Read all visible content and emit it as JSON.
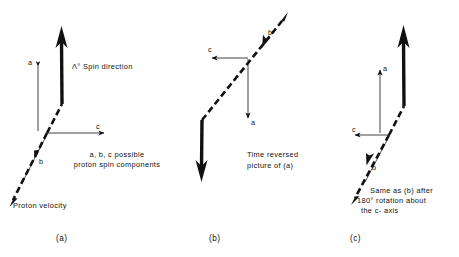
{
  "figure": {
    "title_visible": false,
    "background_color": "#ffffff",
    "ink_color": "#111111"
  },
  "panels": [
    {
      "id": "a",
      "panel_label": "(a)",
      "annotations": {
        "spin_direction": "Λ° Spin direction",
        "components_note_line1": "a, b, c possible",
        "components_note_line2": "proton spin components",
        "velocity_label": "Proton velocity"
      },
      "axes": [
        {
          "name": "a",
          "label": "a",
          "direction": "down"
        },
        {
          "name": "b",
          "label": "b",
          "direction": "up-right"
        },
        {
          "name": "c",
          "label": "c",
          "direction": "right"
        }
      ],
      "vectors": [
        {
          "name": "lambda-spin",
          "style": "thick-solid",
          "direction": "up"
        },
        {
          "name": "proton-velocity",
          "style": "dashed",
          "direction": "down-left"
        }
      ]
    },
    {
      "id": "b",
      "panel_label": "(b)",
      "annotations": {
        "caption_line1": "Time reversed",
        "caption_line2": "picture of (a)"
      },
      "axes": [
        {
          "name": "a",
          "label": "a",
          "direction": "down"
        },
        {
          "name": "b",
          "label": "b",
          "direction": "up-right"
        },
        {
          "name": "c",
          "label": "c",
          "direction": "left"
        }
      ],
      "vectors": [
        {
          "name": "lambda-spin",
          "style": "thick-solid",
          "direction": "down"
        },
        {
          "name": "proton-velocity",
          "style": "dashed",
          "direction": "up-right"
        }
      ]
    },
    {
      "id": "c",
      "panel_label": "(c)",
      "annotations": {
        "caption_line1": "Same as (b) after",
        "caption_line2": "180° rotation about",
        "caption_line3": "the c- axis"
      },
      "axes": [
        {
          "name": "a",
          "label": "a",
          "direction": "up"
        },
        {
          "name": "b",
          "label": "b",
          "direction": "down-left"
        },
        {
          "name": "c",
          "label": "c",
          "direction": "left"
        }
      ],
      "vectors": [
        {
          "name": "lambda-spin",
          "style": "thick-solid",
          "direction": "up"
        },
        {
          "name": "proton-velocity",
          "style": "dashed",
          "direction": "down-left"
        }
      ]
    }
  ]
}
